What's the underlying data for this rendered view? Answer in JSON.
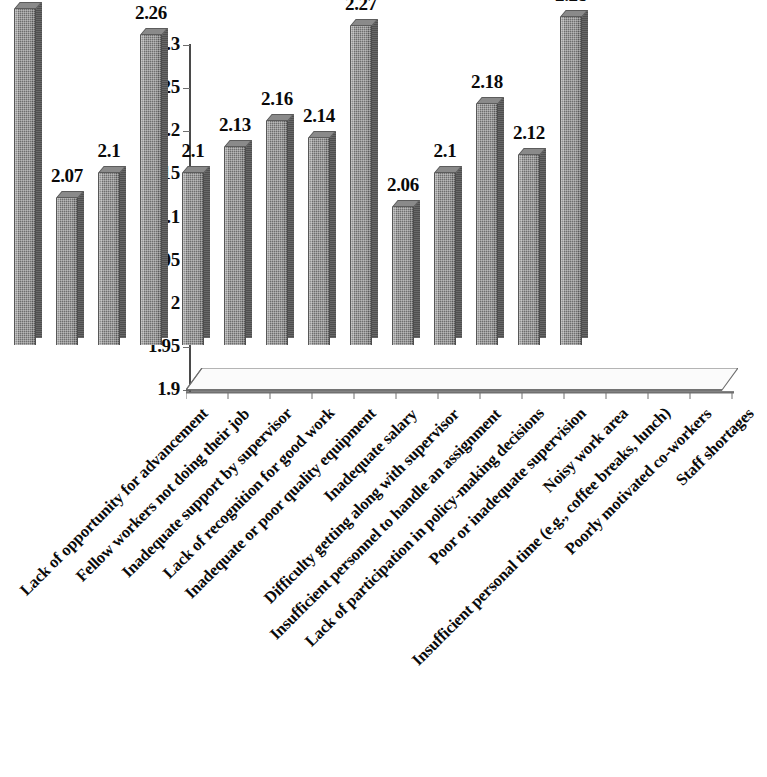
{
  "chart_data": {
    "type": "bar",
    "title": "",
    "subtitle": "",
    "xlabel": "",
    "ylabel": "",
    "ylim": [
      1.9,
      2.3
    ],
    "y_tick_step": 0.05,
    "y_ticks": [
      "1.9",
      "1.95",
      "2",
      "2.05",
      "2.1",
      "2.15",
      "2.2",
      "2.25",
      "2.3"
    ],
    "grid": true,
    "legend": false,
    "legend_position": "none",
    "three_d": true,
    "bar_color": "#6f6f6f",
    "text_color": "#0a0a0a",
    "axis_color": "#4a4a4a",
    "categories": [
      "Lack of opportunity for advancement",
      "Fellow workers not doing their job",
      "Inadequate support by supervisor",
      "Lack of recognition for good work",
      "Inadequate or poor quality equipment",
      "Inadequate salary",
      "Difficulty getting along with supervisor",
      "Insufficient personnel to handle an assignment",
      "Lack of participation in policy-making decisions",
      "Poor or inadequate supervision",
      "Noisy work area",
      "Insufficient personal time (e.g., coffee breaks, lunch)",
      "Poorly motivated co-workers",
      "Staff shortages"
    ],
    "values": [
      2.29,
      2.07,
      2.1,
      2.26,
      2.1,
      2.13,
      2.16,
      2.14,
      2.27,
      2.06,
      2.1,
      2.18,
      2.12,
      2.28
    ],
    "value_labels": [
      "2.29",
      "2.07",
      "2.1",
      "2.26",
      "2.1",
      "2.13",
      "2.16",
      "2.14",
      "2.27",
      "2.06",
      "2.1",
      "2.18",
      "2.12",
      "2.28"
    ]
  }
}
